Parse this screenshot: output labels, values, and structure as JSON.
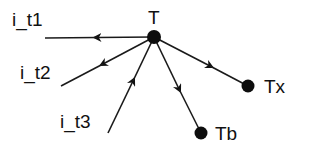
{
  "diagram": {
    "type": "directed-graph",
    "nodes": [
      {
        "id": "T",
        "label": "T",
        "x": 154,
        "y": 37,
        "r": 7,
        "label_x": 148,
        "label_y": 24
      },
      {
        "id": "Tx",
        "label": "Tx",
        "x": 248,
        "y": 86,
        "r": 6.5,
        "label_x": 264,
        "label_y": 93
      },
      {
        "id": "Tb",
        "label": "Tb",
        "x": 201,
        "y": 133,
        "r": 6.5,
        "label_x": 215,
        "label_y": 140
      }
    ],
    "inputs": [
      {
        "id": "i_t1",
        "label": "i_t1",
        "label_x": 12,
        "label_y": 26
      },
      {
        "id": "i_t2",
        "label": "i_t2",
        "label_x": 20,
        "label_y": 79
      },
      {
        "id": "i_t3",
        "label": "i_t3",
        "label_x": 60,
        "label_y": 128
      }
    ],
    "edges": [
      {
        "from": "T",
        "to": "i_t1",
        "direction": "outgoing",
        "x1": 154,
        "y1": 37,
        "x2": 45,
        "y2": 38
      },
      {
        "from": "T",
        "to": "i_t2",
        "direction": "outgoing",
        "x1": 154,
        "y1": 37,
        "x2": 61,
        "y2": 86
      },
      {
        "from": "i_t3",
        "to": "T",
        "direction": "incoming",
        "x1": 108,
        "y1": 133,
        "x2": 154,
        "y2": 37
      },
      {
        "from": "T",
        "to": "Tx",
        "direction": "outgoing",
        "x1": 154,
        "y1": 37,
        "x2": 248,
        "y2": 86
      },
      {
        "from": "T",
        "to": "Tb",
        "direction": "outgoing",
        "x1": 154,
        "y1": 37,
        "x2": 201,
        "y2": 133
      }
    ],
    "colors": {
      "ink": "#111111",
      "background": "#ffffff"
    }
  }
}
